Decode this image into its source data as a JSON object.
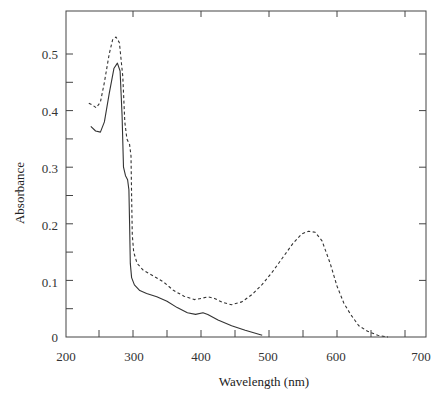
{
  "chart_data": {
    "type": "line",
    "title": "",
    "xlabel": "Wavelength (nm)",
    "ylabel": "Absorbance",
    "xlim": [
      200,
      730
    ],
    "ylim": [
      0,
      0.56
    ],
    "x_ticks": [
      200,
      300,
      400,
      500,
      600,
      700
    ],
    "x_minor_ticks": [
      250,
      350,
      450,
      550,
      650
    ],
    "y_ticks": [
      0,
      0.1,
      0.2,
      0.3,
      0.4,
      0.5
    ],
    "y_tick_labels": [
      "0",
      "0.1",
      "0.2",
      "0.3",
      "0.4",
      "0.5"
    ],
    "y_minor_ticks": [
      0.05,
      0.15,
      0.25,
      0.35,
      0.45
    ],
    "grid": false,
    "legend": null,
    "series": [
      {
        "name": "solid",
        "style": "solid",
        "color": "#333333",
        "points": [
          [
            238,
            0.372
          ],
          [
            245,
            0.364
          ],
          [
            252,
            0.362
          ],
          [
            258,
            0.38
          ],
          [
            265,
            0.43
          ],
          [
            272,
            0.475
          ],
          [
            277,
            0.484
          ],
          [
            281,
            0.47
          ],
          [
            284,
            0.39
          ],
          [
            286,
            0.3
          ],
          [
            289,
            0.285
          ],
          [
            292,
            0.278
          ],
          [
            294,
            0.26
          ],
          [
            295,
            0.2
          ],
          [
            296,
            0.13
          ],
          [
            298,
            0.105
          ],
          [
            302,
            0.092
          ],
          [
            310,
            0.082
          ],
          [
            320,
            0.077
          ],
          [
            335,
            0.071
          ],
          [
            350,
            0.063
          ],
          [
            365,
            0.052
          ],
          [
            380,
            0.043
          ],
          [
            392,
            0.04
          ],
          [
            403,
            0.043
          ],
          [
            410,
            0.04
          ],
          [
            425,
            0.03
          ],
          [
            445,
            0.02
          ],
          [
            465,
            0.012
          ],
          [
            490,
            0.003
          ]
        ]
      },
      {
        "name": "dashed",
        "style": "dashed",
        "color": "#333333",
        "points": [
          [
            235,
            0.413
          ],
          [
            240,
            0.41
          ],
          [
            246,
            0.405
          ],
          [
            252,
            0.415
          ],
          [
            258,
            0.45
          ],
          [
            265,
            0.5
          ],
          [
            270,
            0.525
          ],
          [
            275,
            0.53
          ],
          [
            280,
            0.52
          ],
          [
            285,
            0.46
          ],
          [
            288,
            0.38
          ],
          [
            291,
            0.35
          ],
          [
            295,
            0.34
          ],
          [
            297,
            0.32
          ],
          [
            298,
            0.25
          ],
          [
            299,
            0.18
          ],
          [
            301,
            0.15
          ],
          [
            306,
            0.13
          ],
          [
            315,
            0.118
          ],
          [
            330,
            0.108
          ],
          [
            345,
            0.097
          ],
          [
            360,
            0.082
          ],
          [
            375,
            0.072
          ],
          [
            390,
            0.066
          ],
          [
            400,
            0.068
          ],
          [
            410,
            0.071
          ],
          [
            420,
            0.068
          ],
          [
            432,
            0.061
          ],
          [
            445,
            0.057
          ],
          [
            460,
            0.062
          ],
          [
            475,
            0.075
          ],
          [
            490,
            0.093
          ],
          [
            505,
            0.115
          ],
          [
            520,
            0.14
          ],
          [
            535,
            0.165
          ],
          [
            548,
            0.182
          ],
          [
            558,
            0.187
          ],
          [
            568,
            0.185
          ],
          [
            578,
            0.17
          ],
          [
            590,
            0.13
          ],
          [
            600,
            0.09
          ],
          [
            610,
            0.06
          ],
          [
            620,
            0.04
          ],
          [
            632,
            0.02
          ],
          [
            645,
            0.01
          ],
          [
            660,
            0.003
          ],
          [
            675,
            0.0
          ]
        ]
      }
    ]
  },
  "labels": {
    "xlabel": "Wavelength (nm)",
    "ylabel": "Absorbance",
    "x_tick_labels": [
      "200",
      "300",
      "400",
      "500",
      "600",
      "700"
    ],
    "y_tick_labels": [
      "0",
      "0.1",
      "0.2",
      "0.3",
      "0.4",
      "0.5"
    ]
  }
}
